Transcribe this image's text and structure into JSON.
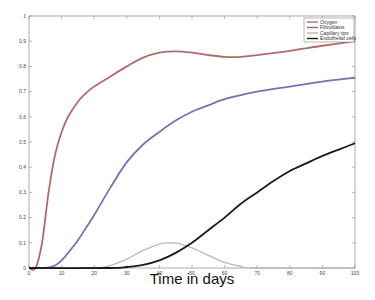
{
  "chart_data": {
    "type": "line",
    "title": "",
    "xlabel": "Time in days",
    "ylabel": "",
    "xlim": [
      0,
      100
    ],
    "ylim": [
      0,
      1
    ],
    "xticks": [
      0,
      10,
      20,
      30,
      40,
      50,
      60,
      70,
      80,
      90,
      100
    ],
    "yticks": [
      0,
      0.1,
      0.2,
      0.3,
      0.4,
      0.5,
      0.6,
      0.7,
      0.8,
      0.9,
      1
    ],
    "xtick_labels": [
      "0",
      "10",
      "20",
      "30",
      "40",
      "50",
      "60",
      "70",
      "80",
      "90",
      "100"
    ],
    "ytick_labels": [
      "0",
      "0.1",
      "0.2",
      "0.3",
      "0.4",
      "0.5",
      "0.6",
      "0.7",
      "0.8",
      "0.9",
      "1"
    ],
    "grid": false,
    "legend_position": "top-right",
    "series": [
      {
        "name": "Oxygen",
        "color": "#b56a6a",
        "x": [
          0,
          2,
          4,
          6,
          8,
          10,
          12,
          15,
          18,
          20,
          25,
          30,
          35,
          40,
          45,
          50,
          55,
          60,
          65,
          70,
          80,
          90,
          100
        ],
        "y": [
          0,
          0,
          0.1,
          0.3,
          0.45,
          0.54,
          0.6,
          0.66,
          0.7,
          0.72,
          0.76,
          0.8,
          0.835,
          0.855,
          0.86,
          0.855,
          0.845,
          0.838,
          0.838,
          0.845,
          0.862,
          0.882,
          0.9
        ]
      },
      {
        "name": "Fibroblasts",
        "color": "#7a6fb0",
        "x": [
          0,
          5,
          8,
          10,
          12,
          15,
          18,
          20,
          25,
          30,
          35,
          40,
          45,
          50,
          55,
          60,
          70,
          80,
          90,
          100
        ],
        "y": [
          0,
          0,
          0.01,
          0.03,
          0.06,
          0.11,
          0.17,
          0.21,
          0.32,
          0.42,
          0.49,
          0.54,
          0.585,
          0.62,
          0.645,
          0.67,
          0.7,
          0.72,
          0.74,
          0.755
        ]
      },
      {
        "name": "Capillary tips",
        "color": "#b8b8b8",
        "x": [
          0,
          20,
          25,
          30,
          35,
          40,
          43,
          46,
          50,
          55,
          60,
          65,
          70,
          100
        ],
        "y": [
          0,
          0,
          0.01,
          0.035,
          0.07,
          0.095,
          0.1,
          0.097,
          0.08,
          0.05,
          0.022,
          0.006,
          0,
          0
        ]
      },
      {
        "name": "Endothelial cells",
        "color": "#1a1a1a",
        "x": [
          0,
          25,
          30,
          35,
          40,
          45,
          50,
          55,
          60,
          65,
          70,
          75,
          80,
          85,
          90,
          95,
          100
        ],
        "y": [
          0,
          0,
          0.004,
          0.012,
          0.03,
          0.06,
          0.1,
          0.15,
          0.2,
          0.255,
          0.3,
          0.345,
          0.385,
          0.415,
          0.445,
          0.47,
          0.495
        ]
      }
    ]
  }
}
